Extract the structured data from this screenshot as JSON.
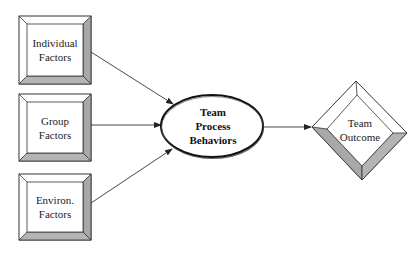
{
  "diagram": {
    "type": "flow",
    "colors": {
      "stroke": "#333333",
      "bevel_dark": "#a8a8a8",
      "bevel_light": "#ffffff",
      "background": "#ffffff"
    },
    "nodes": [
      {
        "id": "individual",
        "shape": "beveled-box",
        "line1": "Individual",
        "line2": "Factors"
      },
      {
        "id": "group",
        "shape": "beveled-box",
        "line1": "Group",
        "line2": "Factors"
      },
      {
        "id": "environ",
        "shape": "beveled-box",
        "line1": "Environ.",
        "line2": "Factors"
      },
      {
        "id": "process",
        "shape": "ellipse",
        "line1": "Team",
        "line2": "Process",
        "line3": "Behaviors"
      },
      {
        "id": "outcome",
        "shape": "beveled-diamond",
        "line1": "Team",
        "line2": "Outcome"
      }
    ],
    "edges": [
      {
        "from": "individual",
        "to": "process"
      },
      {
        "from": "group",
        "to": "process"
      },
      {
        "from": "environ",
        "to": "process"
      },
      {
        "from": "process",
        "to": "outcome"
      }
    ]
  }
}
